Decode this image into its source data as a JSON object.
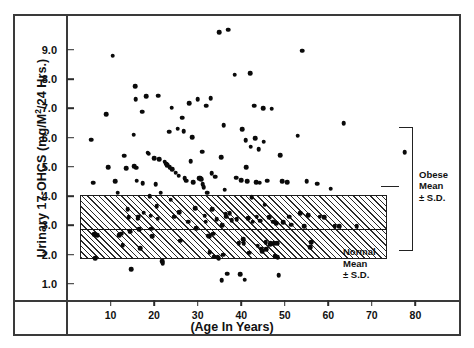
{
  "chart_data": {
    "type": "scatter",
    "title": "",
    "xlabel": "(Age In Years)",
    "ylabel": "Urinary 17-OHCS (mg/M2/24 Hrs.)",
    "ylabel_prefix": "Urinary 17-OHCS (mg/M",
    "ylabel_sup": "2",
    "ylabel_suffix": "/24 Hrs.)",
    "xlim": [
      0,
      90
    ],
    "ylim": [
      0.45,
      10.15
    ],
    "grid": false,
    "xticks": [
      10,
      20,
      30,
      40,
      50,
      60,
      70,
      80
    ],
    "xtick_labels": [
      "10",
      "20",
      "30",
      "40",
      "50",
      "60",
      "70",
      "80"
    ],
    "yticks": [
      1.0,
      2.0,
      3.0,
      4.0,
      5.0,
      6.0,
      7.0,
      8.0,
      9.0
    ],
    "ytick_labels": [
      "1.0",
      "2.0",
      "3.0",
      "4.0",
      "5.0",
      "6.0",
      "7.0",
      "8.0",
      "9.0"
    ],
    "marker_color": "#0a0a0a",
    "band": {
      "label": "normal-range-band",
      "y_low": 1.85,
      "y_high": 4.05,
      "mean": 2.88,
      "x_start": 3.0,
      "x_end": 73.5,
      "fill": "diagonal-hatch",
      "hatch_color": "#2a2a2a"
    },
    "annotations": [
      {
        "name": "obese-mean-bracket",
        "lines": [
          "Obese",
          "Mean",
          "± S.D."
        ],
        "y_top": 6.35,
        "y_mid": 4.35,
        "y_bottom": 2.12
      },
      {
        "name": "normal-mean-bracket",
        "lines": [
          "Normal",
          "Mean",
          "± S.D."
        ],
        "y_top": 4.35,
        "y_bottom": 2.12
      }
    ],
    "points": [
      [
        5.5,
        5.92
      ],
      [
        6.0,
        4.45
      ],
      [
        6.3,
        2.7
      ],
      [
        6.6,
        2.68
      ],
      [
        7.0,
        2.67
      ],
      [
        6.5,
        1.88
      ],
      [
        9.0,
        6.8
      ],
      [
        9.5,
        4.98
      ],
      [
        10.5,
        8.8
      ],
      [
        11.0,
        4.5
      ],
      [
        11.6,
        4.12
      ],
      [
        12.0,
        2.66
      ],
      [
        12.4,
        2.72
      ],
      [
        12.8,
        2.33
      ],
      [
        13.2,
        5.38
      ],
      [
        13.6,
        4.96
      ],
      [
        13.9,
        3.55
      ],
      [
        14.2,
        3.27
      ],
      [
        14.4,
        2.8
      ],
      [
        14.6,
        2.78
      ],
      [
        14.8,
        1.5
      ],
      [
        15.3,
        6.1
      ],
      [
        15.4,
        5.02
      ],
      [
        15.6,
        7.75
      ],
      [
        15.8,
        7.3
      ],
      [
        15.9,
        4.97
      ],
      [
        16.0,
        4.52
      ],
      [
        16.2,
        3.22
      ],
      [
        16.4,
        3.3
      ],
      [
        16.6,
        2.86
      ],
      [
        16.8,
        2.22
      ],
      [
        17.2,
        6.88
      ],
      [
        17.4,
        4.43
      ],
      [
        17.6,
        3.43
      ],
      [
        18.2,
        7.42
      ],
      [
        18.5,
        5.48
      ],
      [
        18.8,
        5.44
      ],
      [
        19.0,
        4.0
      ],
      [
        19.2,
        3.33
      ],
      [
        19.4,
        2.88
      ],
      [
        19.6,
        2.62
      ],
      [
        20.0,
        5.3
      ],
      [
        20.4,
        4.4
      ],
      [
        20.6,
        3.65
      ],
      [
        20.8,
        3.22
      ],
      [
        21.0,
        7.43
      ],
      [
        21.2,
        5.26
      ],
      [
        21.5,
        4.12
      ],
      [
        21.8,
        1.78
      ],
      [
        22.0,
        1.7
      ],
      [
        22.4,
        5.18
      ],
      [
        22.8,
        5.1
      ],
      [
        23.0,
        5.05
      ],
      [
        23.4,
        6.2
      ],
      [
        23.6,
        4.98
      ],
      [
        23.8,
        3.87
      ],
      [
        24.0,
        7.02
      ],
      [
        24.2,
        4.92
      ],
      [
        24.6,
        3.3
      ],
      [
        25.0,
        4.8
      ],
      [
        25.4,
        6.3
      ],
      [
        25.6,
        4.7
      ],
      [
        25.8,
        3.44
      ],
      [
        26.0,
        2.48
      ],
      [
        26.5,
        6.68
      ],
      [
        26.8,
        6.22
      ],
      [
        27.0,
        4.62
      ],
      [
        27.4,
        4.52
      ],
      [
        27.8,
        3.12
      ],
      [
        28.0,
        7.18
      ],
      [
        28.4,
        5.2
      ],
      [
        28.8,
        6.02
      ],
      [
        29.0,
        4.48
      ],
      [
        29.4,
        3.58
      ],
      [
        29.6,
        2.9
      ],
      [
        30.0,
        7.3
      ],
      [
        30.4,
        4.62
      ],
      [
        30.6,
        4.6
      ],
      [
        30.8,
        4.58
      ],
      [
        31.0,
        5.52
      ],
      [
        31.2,
        4.4
      ],
      [
        31.4,
        4.3
      ],
      [
        31.6,
        3.33
      ],
      [
        31.8,
        3.12
      ],
      [
        32.0,
        7.08
      ],
      [
        32.2,
        4.12
      ],
      [
        32.4,
        2.64
      ],
      [
        32.6,
        2.62
      ],
      [
        32.8,
        2.08
      ],
      [
        33.0,
        7.34
      ],
      [
        33.2,
        4.78
      ],
      [
        33.4,
        3.56
      ],
      [
        33.6,
        2.72
      ],
      [
        33.8,
        1.93
      ],
      [
        34.0,
        4.66
      ],
      [
        34.4,
        3.2
      ],
      [
        34.6,
        1.92
      ],
      [
        34.8,
        1.88
      ],
      [
        35.0,
        9.6
      ],
      [
        35.4,
        5.32
      ],
      [
        35.6,
        3.0
      ],
      [
        35.8,
        2.0
      ],
      [
        35.5,
        1.12
      ],
      [
        36.0,
        6.42
      ],
      [
        36.2,
        4.22
      ],
      [
        36.4,
        3.38
      ],
      [
        36.6,
        3.3
      ],
      [
        36.8,
        1.35
      ],
      [
        37.0,
        9.68
      ],
      [
        37.4,
        3.42
      ],
      [
        37.8,
        3.18
      ],
      [
        38.5,
        8.14
      ],
      [
        38.8,
        4.63
      ],
      [
        39.0,
        3.2
      ],
      [
        39.4,
        2.4
      ],
      [
        39.8,
        1.34
      ],
      [
        40.0,
        4.55
      ],
      [
        40.2,
        6.28
      ],
      [
        40.4,
        2.52
      ],
      [
        40.6,
        2.38
      ],
      [
        40.8,
        1.14
      ],
      [
        41.0,
        5.9
      ],
      [
        41.2,
        4.98
      ],
      [
        41.4,
        4.5
      ],
      [
        41.6,
        3.24
      ],
      [
        41.8,
        2.06
      ],
      [
        42.0,
        8.2
      ],
      [
        42.2,
        5.68
      ],
      [
        42.4,
        3.96
      ],
      [
        42.6,
        3.12
      ],
      [
        43.0,
        7.08
      ],
      [
        43.2,
        5.98
      ],
      [
        43.4,
        4.48
      ],
      [
        43.6,
        3.3
      ],
      [
        43.8,
        2.3
      ],
      [
        44.0,
        5.6
      ],
      [
        44.2,
        4.46
      ],
      [
        44.4,
        3.16
      ],
      [
        44.6,
        2.2
      ],
      [
        44.8,
        2.12
      ],
      [
        45.0,
        7.0
      ],
      [
        45.2,
        5.86
      ],
      [
        45.4,
        3.7
      ],
      [
        45.6,
        2.42
      ],
      [
        45.8,
        2.18
      ],
      [
        46.0,
        4.52
      ],
      [
        46.4,
        3.28
      ],
      [
        46.6,
        2.36
      ],
      [
        46.8,
        2.4
      ],
      [
        47.0,
        6.98
      ],
      [
        47.4,
        3.12
      ],
      [
        47.6,
        2.4
      ],
      [
        47.8,
        1.94
      ],
      [
        48.0,
        3.08
      ],
      [
        48.2,
        2.38
      ],
      [
        48.4,
        1.92
      ],
      [
        48.6,
        1.3
      ],
      [
        49.0,
        5.4
      ],
      [
        49.4,
        4.5
      ],
      [
        49.6,
        3.1
      ],
      [
        50.5,
        4.48
      ],
      [
        51.0,
        3.3
      ],
      [
        51.5,
        3.02
      ],
      [
        53.0,
        6.06
      ],
      [
        53.5,
        3.42
      ],
      [
        54.0,
        8.97
      ],
      [
        54.4,
        2.98
      ],
      [
        55.0,
        4.5
      ],
      [
        55.4,
        3.35
      ],
      [
        55.8,
        2.26
      ],
      [
        56.0,
        2.42
      ],
      [
        57.5,
        4.42
      ],
      [
        58.0,
        3.3
      ],
      [
        59.0,
        3.28
      ],
      [
        60.5,
        4.25
      ],
      [
        61.5,
        2.97
      ],
      [
        62.5,
        2.98
      ],
      [
        63.5,
        6.48
      ],
      [
        66.5,
        2.97
      ],
      [
        77.5,
        5.5
      ]
    ]
  }
}
